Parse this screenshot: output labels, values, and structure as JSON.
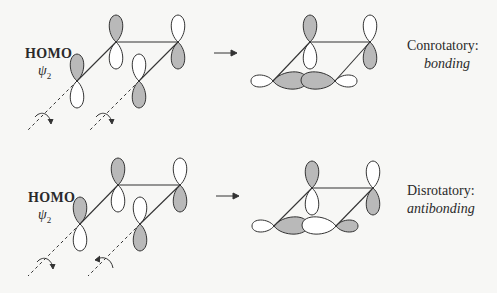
{
  "colors": {
    "background": "#f7f7f5",
    "line": "#333333",
    "shaded_lobe": "#b9b9b9",
    "open_lobe": "#ffffff"
  },
  "panels": [
    {
      "id": "conrotatory",
      "orbital_label": "HOMO",
      "orbital_symbol": "ψ",
      "orbital_subscript": "2",
      "reaction_arrow": "→",
      "mode_label": "Conrotatory:",
      "result_label": "bonding",
      "rotation_arrows": [
        "clockwise",
        "clockwise"
      ],
      "reactant_lobes": [
        {
          "carbon": "C1",
          "top": "shaded",
          "bottom": "open"
        },
        {
          "carbon": "C2",
          "top": "shaded",
          "bottom": "open"
        },
        {
          "carbon": "C3",
          "top": "open",
          "bottom": "shaded"
        },
        {
          "carbon": "C4",
          "top": "open",
          "bottom": "shaded"
        }
      ],
      "product_sigma_lobes": [
        "open",
        "shaded",
        "shaded",
        "open"
      ]
    },
    {
      "id": "disrotatory",
      "orbital_label": "HOMO",
      "orbital_symbol": "ψ",
      "orbital_subscript": "2",
      "reaction_arrow": "→",
      "mode_label": "Disrotatory:",
      "result_label": "antibonding",
      "rotation_arrows": [
        "clockwise",
        "counterclockwise"
      ],
      "reactant_lobes": [
        {
          "carbon": "C1",
          "top": "shaded",
          "bottom": "open"
        },
        {
          "carbon": "C2",
          "top": "shaded",
          "bottom": "open"
        },
        {
          "carbon": "C3",
          "top": "open",
          "bottom": "shaded"
        },
        {
          "carbon": "C4",
          "top": "open",
          "bottom": "shaded"
        }
      ],
      "product_sigma_lobes": [
        "open",
        "shaded",
        "open",
        "shaded"
      ]
    }
  ]
}
